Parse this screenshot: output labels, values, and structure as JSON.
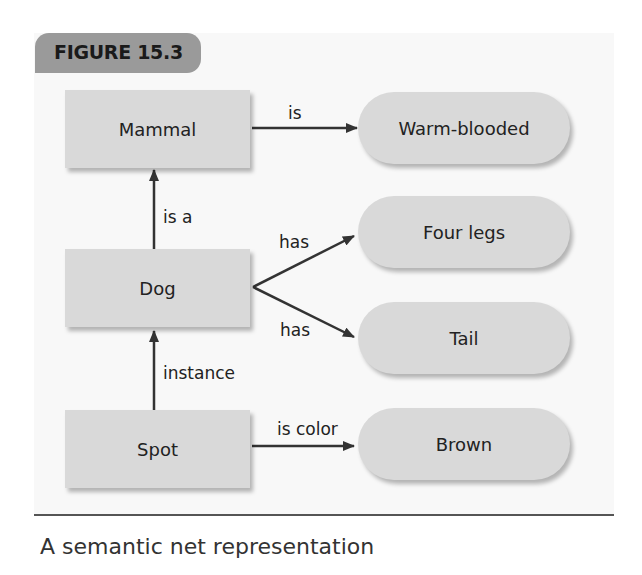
{
  "figure": {
    "label": "FIGURE 15.3",
    "caption": "A semantic net representation",
    "colors": {
      "node_fill": "#d9d9d9",
      "tab_fill": "#9a9a9a",
      "panel_fill": "#f8f8f8",
      "arrow": "#333333"
    }
  },
  "nodes": {
    "mammal": "Mammal",
    "dog": "Dog",
    "spot": "Spot",
    "warm_blooded": "Warm-blooded",
    "four_legs": "Four legs",
    "tail": "Tail",
    "brown": "Brown"
  },
  "edges": {
    "mammal_warm": "is",
    "dog_mammal": "is a",
    "dog_legs": "has",
    "dog_tail": "has",
    "spot_dog": "instance",
    "spot_brown": "is color"
  }
}
